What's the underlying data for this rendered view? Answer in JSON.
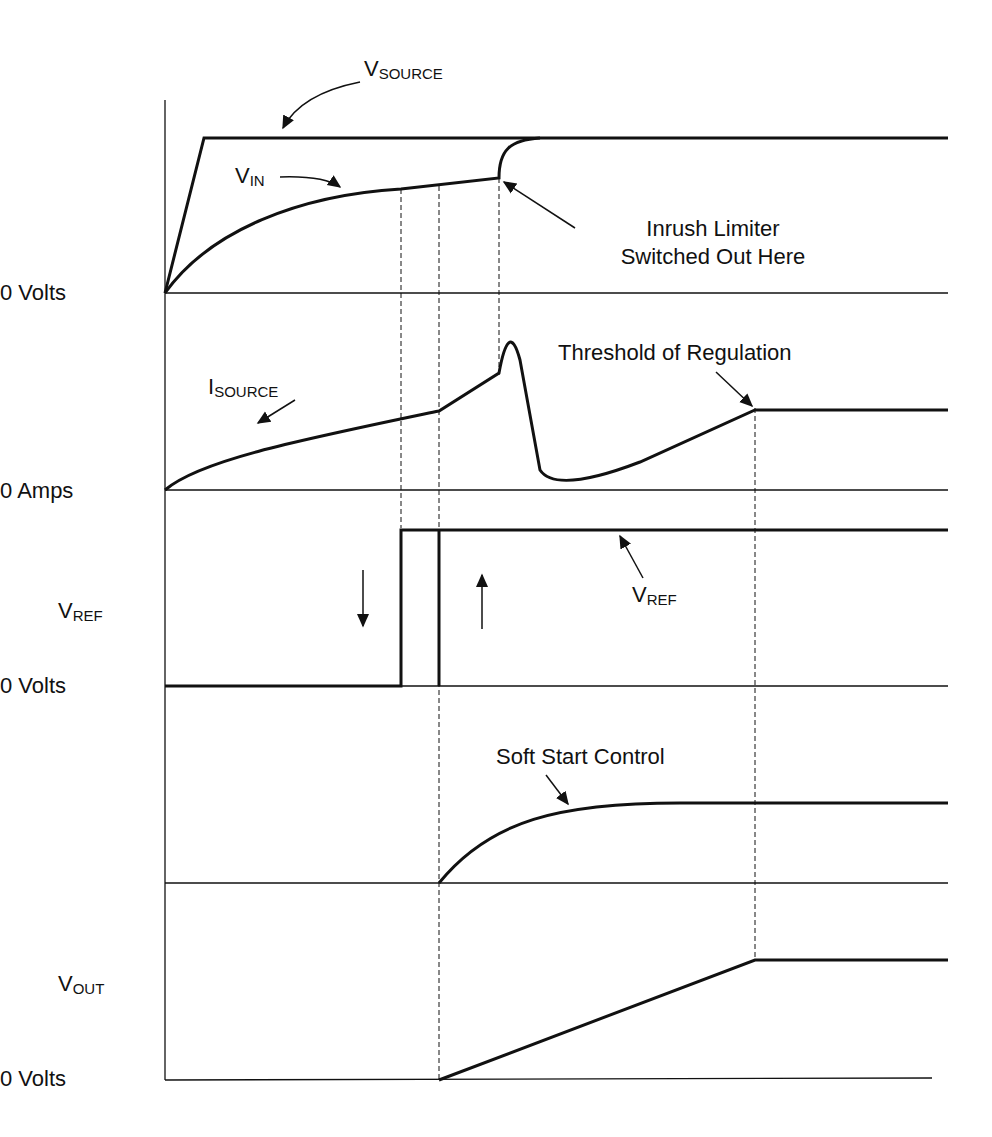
{
  "figure": {
    "title": "",
    "panels": [
      {
        "id": "vin",
        "axis_label": "0 Volts"
      },
      {
        "id": "isource",
        "axis_label": "0 Amps"
      },
      {
        "id": "vref",
        "signal_label": {
          "main": "V",
          "sub": "REF"
        },
        "axis_label": "0 Volts"
      },
      {
        "id": "softstart",
        "axis_label": ""
      },
      {
        "id": "vout",
        "signal_label": {
          "main": "V",
          "sub": "OUT"
        },
        "axis_label": "0 Volts"
      }
    ],
    "annotations": {
      "vsource": {
        "main": "V",
        "sub": "SOURCE"
      },
      "vin": {
        "main": "V",
        "sub": "IN"
      },
      "inrush_line1": "Inrush Limiter",
      "inrush_line2": "Switched Out Here",
      "isource": {
        "main": "I",
        "sub": "SOURCE"
      },
      "threshold": "Threshold of Regulation",
      "vref_curve": {
        "main": "V",
        "sub": "REF"
      },
      "soft_start": "Soft Start Control"
    }
  },
  "colors": {
    "line": "#111111",
    "background": "#ffffff"
  }
}
